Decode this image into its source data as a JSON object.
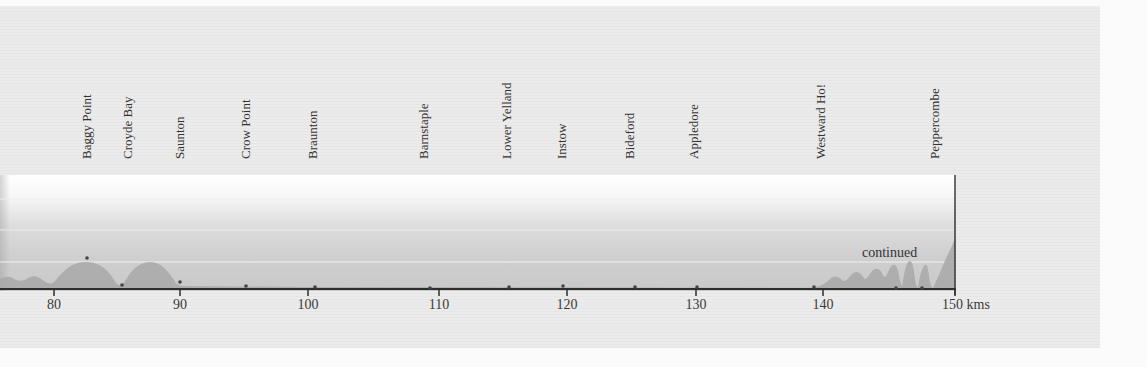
{
  "chart_data": {
    "type": "area",
    "title": "",
    "xlabel": "kms",
    "ylabel": "",
    "xlim": [
      76,
      150
    ],
    "x_ticks": [
      80,
      90,
      100,
      110,
      120,
      130,
      140,
      150
    ],
    "x_tick_labels": [
      "80",
      "90",
      "100",
      "110",
      "120",
      "130",
      "140",
      "150 kms"
    ],
    "grid": true,
    "annotation": "continued",
    "locations": [
      {
        "name": "Baggy Point",
        "km": 82.6
      },
      {
        "name": "Croyde Bay",
        "km": 85.4
      },
      {
        "name": "Saunton",
        "km": 90.0
      },
      {
        "name": "Crow Point",
        "km": 95.1
      },
      {
        "name": "Braunton",
        "km": 100.5
      },
      {
        "name": "Barnstaple",
        "km": 109.2
      },
      {
        "name": "Lower Yelland",
        "km": 115.4
      },
      {
        "name": "Instow",
        "km": 119.6
      },
      {
        "name": "Bideford",
        "km": 125.2
      },
      {
        "name": "Appledore",
        "km": 130.1
      },
      {
        "name": "Westward Ho!",
        "km": 139.2
      },
      {
        "name": "Peppercombe",
        "km": 147.6
      }
    ],
    "profile": {
      "x": [
        76,
        77,
        78,
        79,
        80,
        81,
        82,
        82.6,
        83.5,
        84.5,
        85.4,
        86.3,
        87,
        87.8,
        88.6,
        89.4,
        90,
        95,
        100,
        110,
        120,
        130,
        139,
        140,
        140.7,
        141.3,
        142,
        142.6,
        143.2,
        143.8,
        144.4,
        145.0,
        145.4,
        145.8,
        146.2,
        146.6,
        147.0,
        147.4,
        147.8,
        148.5,
        149.3,
        150
      ],
      "elevation_rel": [
        0.12,
        0.18,
        0.22,
        0.14,
        0.1,
        0.35,
        0.55,
        0.6,
        0.52,
        0.25,
        0.05,
        0.35,
        0.58,
        0.6,
        0.45,
        0.15,
        0.08,
        0.02,
        0.01,
        0.01,
        0.01,
        0.01,
        0.02,
        0.15,
        0.22,
        0.18,
        0.28,
        0.22,
        0.35,
        0.26,
        0.45,
        0.6,
        0.1,
        0.58,
        0.62,
        0.12,
        0.48,
        0.05,
        0.3,
        0.6,
        0.85,
        1.0
      ]
    }
  },
  "locations": [
    {
      "label": "Baggy Point"
    },
    {
      "label": "Croyde Bay"
    },
    {
      "label": "Saunton"
    },
    {
      "label": "Crow Point"
    },
    {
      "label": "Braunton"
    },
    {
      "label": "Barnstaple"
    },
    {
      "label": "Lower Yelland"
    },
    {
      "label": "Instow"
    },
    {
      "label": "Bideford"
    },
    {
      "label": "Appledore"
    },
    {
      "label": "Westward Ho!"
    },
    {
      "label": "Peppercombe"
    }
  ],
  "axis": {
    "ticks": [
      "80",
      "90",
      "100",
      "110",
      "120",
      "130",
      "140",
      "150"
    ],
    "unit": "kms"
  },
  "annotation": "continued",
  "colors": {
    "profile_fill": "#a9a9a9",
    "axis_line": "#333333",
    "gridline": "#f2f2f2",
    "marker": "#444444"
  }
}
